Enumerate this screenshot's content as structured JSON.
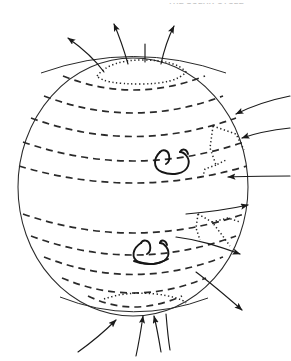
{
  "page": {
    "width": 291,
    "height": 361,
    "background": "#ffffff",
    "ink_color": "#1a1a1a"
  },
  "header": {
    "text": "THE SOLAR CYCLE",
    "note": "clipped at top edge of page"
  },
  "figure": {
    "name": "solar-magnetic-field-sphere",
    "sphere": {
      "cx": 133,
      "cy": 187,
      "rx": 115,
      "ry": 129,
      "stroke": "#2a2a2a",
      "stroke_width": 1.0
    },
    "latitudes": {
      "style": "dashed",
      "dash": "7 5",
      "stroke": "#2a2a2a",
      "stroke_width": 1.6,
      "count_north": 6,
      "count_south": 5,
      "y_offsets": [
        -113,
        -96,
        -77,
        -56,
        -33,
        -10,
        26,
        48,
        68,
        86,
        101
      ]
    },
    "polar_caps": {
      "style": "dotted",
      "dash": "1.4 2.6",
      "north_label": "north-polar-cap",
      "south_label": "south-polar-cap"
    },
    "boundary_regions": {
      "style": "dotted",
      "right_upper_label": "right-upper-dotted-boundary",
      "right_lower_label": "right-lower-dotted-boundary"
    },
    "loops": [
      {
        "name": "north-equatorial-flux-loop",
        "cx": 172,
        "cy": 163
      },
      {
        "name": "south-equatorial-flux-loop",
        "cx": 152,
        "cy": 251
      }
    ],
    "field_arrows": {
      "north_outward_count": 4,
      "south_inward_count": 4,
      "right_inward_count": 3,
      "right_outward_count": 3,
      "stroke": "#1a1a1a",
      "stroke_width": 1.1
    }
  }
}
